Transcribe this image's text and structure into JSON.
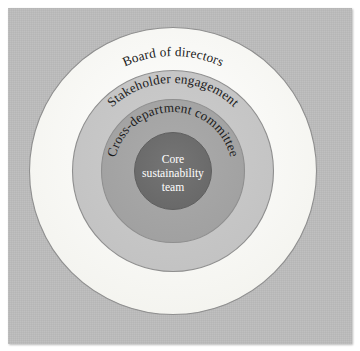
{
  "diagram": {
    "type": "concentric-circles",
    "title": "",
    "background_color": "#bcbcbc",
    "page_color": "#ffffff",
    "rings": [
      {
        "index": 0,
        "label": "Board of directors",
        "fill": "#fbfbf8",
        "stroke": "#8a8a8a",
        "diameter": 287,
        "label_position": "arc-top"
      },
      {
        "index": 1,
        "label": "Stakeholder engagement",
        "fill": "#c7c7c7",
        "stroke": "#8a8a8a",
        "diameter": 201,
        "label_position": "arc-top"
      },
      {
        "index": 2,
        "label": "Cross-department committee",
        "fill": "#a6a6a6",
        "stroke": "#8a8a8a",
        "diameter": 143,
        "label_position": "arc-top"
      },
      {
        "index": 3,
        "label": "Core sustainability team",
        "label_lines": [
          "Core",
          "sustainability",
          "team"
        ],
        "fill": "#6e6e6e",
        "stroke": "#5c5c5c",
        "diameter": 77,
        "label_position": "center",
        "label_color": "#ffffff"
      }
    ],
    "center": {
      "x": 173,
      "y": 171
    }
  }
}
